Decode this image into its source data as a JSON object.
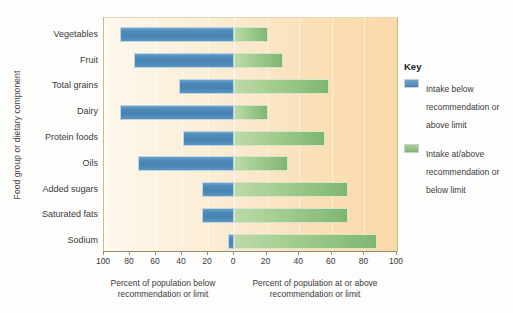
{
  "chart_data": {
    "type": "bar",
    "title": "",
    "subtitle": "",
    "ylabel": "Food group or dietary component",
    "xlabel_left": "Percent of population below recommendation or limit",
    "xlabel_right": "Percent of population at or above recommendation or limit",
    "orientation": "horizontal-diverging",
    "categories": [
      "Vegetables",
      "Fruit",
      "Total grains",
      "Dairy",
      "Protein foods",
      "Oils",
      "Added sugars",
      "Saturated fats",
      "Sodium"
    ],
    "axis_left_ticks": [
      100,
      80,
      60,
      40,
      20,
      0
    ],
    "axis_right_ticks": [
      0,
      20,
      40,
      60,
      80,
      100
    ],
    "xlim_left": [
      0,
      100
    ],
    "xlim_right": [
      0,
      100
    ],
    "grid": true,
    "legend_position": "right",
    "series": [
      {
        "name": "Intake below recommendation or above limit",
        "color": "#4683b2",
        "side": "left",
        "values": [
          88,
          77,
          42,
          88,
          39,
          74,
          25,
          25,
          5
        ]
      },
      {
        "name": "Intake at/above recommendation or below limit",
        "color": "#8cbf7e",
        "side": "right",
        "values": [
          21,
          30,
          58,
          21,
          56,
          33,
          70,
          70,
          88
        ]
      }
    ]
  },
  "legend": {
    "title": "Key",
    "entries": [
      {
        "swatch": "blue",
        "label": "Intake below recommendation or above limit"
      },
      {
        "swatch": "green",
        "label": "Intake at/above recommendation or below limit"
      }
    ]
  },
  "colors": {
    "blue": "#4683b2",
    "green": "#8cbf7e",
    "plot_background_left": "#fdf9ef",
    "plot_background_right": "#fbd9a8",
    "axis": "#9b8f6b"
  }
}
